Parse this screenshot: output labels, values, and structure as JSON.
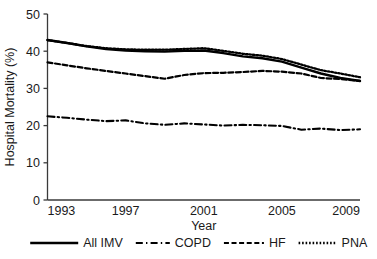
{
  "chart_data": {
    "type": "line",
    "title": "",
    "xlabel": "Year",
    "ylabel": "Hospital Mortality (%)",
    "xlim": [
      1993,
      2009
    ],
    "ylim": [
      0,
      50
    ],
    "xticks": [
      1993,
      1997,
      2001,
      2005,
      2009
    ],
    "yticks": [
      0,
      10,
      20,
      30,
      40,
      50
    ],
    "grid": false,
    "legend_position": "bottom",
    "x": [
      1993,
      1994,
      1995,
      1996,
      1997,
      1998,
      1999,
      2000,
      2001,
      2002,
      2003,
      2004,
      2005,
      2006,
      2007,
      2008,
      2009
    ],
    "series": [
      {
        "name": "All IMV",
        "style": "solid",
        "values": [
          43.0,
          42.2,
          41.3,
          40.6,
          40.2,
          40.0,
          39.9,
          40.1,
          40.2,
          39.5,
          38.6,
          38.1,
          37.2,
          35.6,
          34.0,
          32.8,
          32.0
        ]
      },
      {
        "name": "COPD",
        "style": "dash-dot",
        "values": [
          22.5,
          22.1,
          21.6,
          21.2,
          21.4,
          20.6,
          20.2,
          20.6,
          20.3,
          20.0,
          20.2,
          20.1,
          19.9,
          18.9,
          19.2,
          18.8,
          19.0
        ]
      },
      {
        "name": "HF",
        "style": "dashed",
        "values": [
          37.0,
          36.2,
          35.4,
          34.7,
          34.0,
          33.3,
          32.6,
          33.6,
          34.1,
          34.2,
          34.4,
          34.7,
          34.5,
          34.0,
          32.8,
          32.5,
          32.0
        ]
      },
      {
        "name": "PNA",
        "style": "dotted",
        "values": [
          43.0,
          42.2,
          41.4,
          40.8,
          40.5,
          40.4,
          40.4,
          40.6,
          40.8,
          40.1,
          39.3,
          38.8,
          37.9,
          36.4,
          34.9,
          34.0,
          33.0
        ]
      }
    ]
  },
  "axes": {
    "ylabel": "Hospital Mortality (%)",
    "xlabel": "Year",
    "yticklabels": [
      "0",
      "10",
      "20",
      "30",
      "40",
      "50"
    ],
    "xticklabels": [
      "1993",
      "1997",
      "2001",
      "2005",
      "2009"
    ]
  },
  "legend": {
    "entries": [
      {
        "label": "All IMV",
        "style": "solid"
      },
      {
        "label": "COPD",
        "style": "dash-dot"
      },
      {
        "label": "HF",
        "style": "dashed"
      },
      {
        "label": "PNA",
        "style": "dotted"
      }
    ]
  },
  "colors": {
    "line": "#000000",
    "axis": "#3a3a3a",
    "text": "#1a1a1a",
    "background": "#ffffff"
  }
}
